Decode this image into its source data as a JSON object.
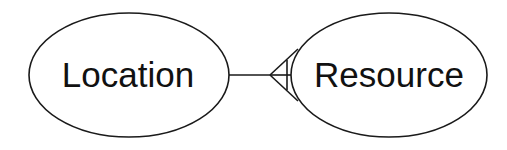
{
  "diagram": {
    "type": "entity-relationship",
    "entities": [
      {
        "id": "location",
        "label": "Location"
      },
      {
        "id": "resource",
        "label": "Resource"
      }
    ],
    "relationships": [
      {
        "from": "location",
        "to": "resource",
        "from_cardinality": "one",
        "to_cardinality": "many",
        "notation": "crows-foot"
      }
    ],
    "colors": {
      "stroke": "#1a1a1a",
      "background": "#ffffff",
      "text": "#111111"
    }
  }
}
